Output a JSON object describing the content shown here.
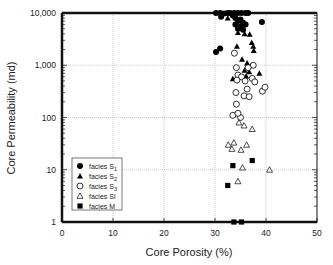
{
  "chart_data": {
    "type": "scatter",
    "title": "",
    "xlabel": "Core Porosity (%)",
    "ylabel": "Core Permeability (md)",
    "xlim": [
      0,
      50
    ],
    "ylim": [
      1,
      10000
    ],
    "yscale": "log",
    "grid": true,
    "legend_position": "lower left (inside plot)",
    "x_ticks": [
      "0",
      "10",
      "20",
      "30",
      "40",
      "50"
    ],
    "y_ticks": [
      "1",
      "10",
      "100",
      "1,000",
      "10,000"
    ],
    "series": [
      {
        "name": "facies S1",
        "marker": "filled-circle",
        "points": [
          [
            30.2,
            10000
          ],
          [
            31,
            10000
          ],
          [
            31.8,
            9800
          ],
          [
            32.5,
            10000
          ],
          [
            33,
            10000
          ],
          [
            33.8,
            10000
          ],
          [
            34.5,
            10000
          ],
          [
            35.2,
            10000
          ],
          [
            36,
            10000
          ],
          [
            36.5,
            10000
          ],
          [
            33.5,
            9000
          ],
          [
            34,
            8000
          ],
          [
            34.5,
            7000
          ],
          [
            35,
            7500
          ],
          [
            35.5,
            6500
          ],
          [
            34,
            6000
          ],
          [
            35,
            5500
          ],
          [
            36,
            6000
          ],
          [
            34.5,
            5000
          ],
          [
            35.5,
            4800
          ],
          [
            39.2,
            6700
          ],
          [
            30.2,
            1800
          ],
          [
            31,
            2100
          ],
          [
            31.2,
            8500
          ]
        ]
      },
      {
        "name": "facies S2",
        "marker": "filled-triangle",
        "points": [
          [
            32.5,
            8000
          ],
          [
            34.5,
            4200
          ],
          [
            35.8,
            4000
          ],
          [
            36.8,
            3900
          ],
          [
            37.2,
            2700
          ],
          [
            37.5,
            2300
          ],
          [
            34.3,
            2300
          ],
          [
            37.6,
            1900
          ],
          [
            35.3,
            1300
          ],
          [
            36.3,
            1100
          ],
          [
            35.8,
            800
          ],
          [
            38.7,
            700
          ],
          [
            33.5,
            550
          ],
          [
            36.7,
            750
          ],
          [
            36.1,
            620
          ]
        ]
      },
      {
        "name": "facies S3",
        "marker": "open-circle",
        "points": [
          [
            33.8,
            1700
          ],
          [
            34.2,
            900
          ],
          [
            37.5,
            1000
          ],
          [
            36.5,
            900
          ],
          [
            34.5,
            650
          ],
          [
            35.2,
            600
          ],
          [
            34.3,
            520
          ],
          [
            35.9,
            500
          ],
          [
            37.3,
            560
          ],
          [
            37.8,
            480
          ],
          [
            39.3,
            320
          ],
          [
            34.1,
            300
          ],
          [
            35.7,
            260
          ],
          [
            36.7,
            250
          ],
          [
            34.2,
            180
          ],
          [
            33.5,
            110
          ],
          [
            35,
            100
          ],
          [
            39.8,
            380
          ],
          [
            36.3,
            350
          ],
          [
            34.5,
            120
          ]
        ]
      },
      {
        "name": "facies Sl",
        "marker": "open-triangle",
        "points": [
          [
            35.7,
            70
          ],
          [
            37.3,
            60
          ],
          [
            32.6,
            30
          ],
          [
            34.7,
            80
          ],
          [
            36.2,
            30
          ],
          [
            33.3,
            25
          ],
          [
            35.1,
            24
          ],
          [
            33.7,
            33
          ],
          [
            35.4,
            11
          ],
          [
            40.7,
            10
          ],
          [
            34.5,
            6
          ]
        ]
      },
      {
        "name": "facies M",
        "marker": "filled-square",
        "points": [
          [
            33.5,
            12
          ],
          [
            37.3,
            15
          ],
          [
            32.5,
            5
          ],
          [
            33.7,
            1
          ],
          [
            35.2,
            1
          ]
        ]
      }
    ]
  },
  "axes": {
    "x_label": "Core Porosity (%)",
    "y_label": "Core Permeability (md)",
    "x_ticks": [
      "0",
      "10",
      "20",
      "30",
      "40",
      "50"
    ],
    "y_ticks": [
      "1",
      "10",
      "100",
      "1,000",
      "10,000"
    ]
  },
  "legend": {
    "items": [
      {
        "label": "facies S",
        "sub": "1",
        "marker": "filled-circle"
      },
      {
        "label": "facies S",
        "sub": "2",
        "marker": "filled-triangle"
      },
      {
        "label": "facies S",
        "sub": "3",
        "marker": "open-circle"
      },
      {
        "label": "facies Sl",
        "sub": "",
        "marker": "open-triangle"
      },
      {
        "label": "facies M",
        "sub": "",
        "marker": "filled-square"
      }
    ]
  }
}
